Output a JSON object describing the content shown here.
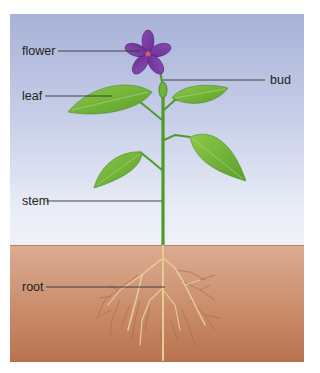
{
  "diagram": {
    "labels": {
      "flower": "flower",
      "leaf": "leaf",
      "bud": "bud",
      "stem": "stem",
      "root": "root"
    },
    "colors": {
      "sky_top": "#a8b2d8",
      "sky_bottom": "#eef1f8",
      "soil_top": "#dcab92",
      "soil_bottom": "#b9714f",
      "stem": "#4f9a2a",
      "leaf": "#74b83a",
      "flower": "#7b3fa3",
      "root": "#e7cf96",
      "leader_line": "#333333"
    }
  }
}
